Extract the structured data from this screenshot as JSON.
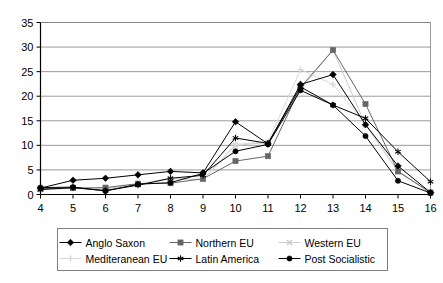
{
  "chart_data": {
    "type": "line",
    "title": "",
    "subtitle": "",
    "xlabel": "",
    "ylabel": "",
    "xlim": [
      4,
      16
    ],
    "ylim": [
      0,
      35
    ],
    "ytick_step": 5,
    "grid": true,
    "legend_position": "bottom",
    "x": [
      4,
      5,
      6,
      7,
      8,
      9,
      10,
      11,
      12,
      13,
      14,
      15,
      16
    ],
    "xtick_labels": [
      "4",
      "5",
      "6",
      "7",
      "8",
      "9",
      "10",
      "11",
      "12",
      "13",
      "14",
      "15",
      "16"
    ],
    "ytick_labels": [
      "0",
      "5",
      "10",
      "15",
      "20",
      "25",
      "30",
      "35"
    ],
    "series": [
      {
        "name": "Anglo Saxon",
        "marker": "diamond",
        "color": "#000000",
        "values": [
          1.3,
          2.9,
          3.3,
          4.0,
          4.7,
          4.4,
          14.8,
          10.3,
          22.4,
          24.4,
          14.2,
          5.8,
          0.4
        ]
      },
      {
        "name": "Northern EU",
        "marker": "square",
        "color": "#666666",
        "values": [
          1.2,
          1.3,
          1.4,
          2.2,
          2.3,
          3.2,
          6.8,
          7.8,
          21.8,
          29.4,
          18.4,
          4.7,
          0.4
        ]
      },
      {
        "name": "Western EU",
        "marker": "cross",
        "color": "#cccccc",
        "values": [
          1.1,
          1.2,
          1.1,
          2.0,
          3.2,
          3.0,
          10.0,
          10.6,
          21.4,
          29.4,
          14.2,
          4.6,
          0.3
        ]
      },
      {
        "name": "Mediteranean EU",
        "marker": "plus",
        "color": "#d9d9d9",
        "values": [
          1.2,
          1.3,
          1.2,
          2.1,
          3.3,
          3.1,
          10.2,
          10.7,
          25.4,
          22.4,
          14.3,
          4.8,
          0.4
        ]
      },
      {
        "name": "Latin America",
        "marker": "asterisk",
        "color": "#000000",
        "values": [
          1.0,
          1.4,
          0.8,
          1.9,
          3.3,
          3.9,
          11.5,
          10.4,
          21.9,
          18.2,
          15.5,
          8.7,
          2.6
        ]
      },
      {
        "name": "Post Socialistic",
        "marker": "circle",
        "color": "#000000",
        "values": [
          1.4,
          1.5,
          0.7,
          2.1,
          2.4,
          4.3,
          8.8,
          10.2,
          21.2,
          18.2,
          11.9,
          2.8,
          0.3
        ]
      }
    ]
  },
  "legend": {
    "items": [
      {
        "label": "Anglo Saxon"
      },
      {
        "label": "Northern EU"
      },
      {
        "label": "Western EU"
      },
      {
        "label": "Mediteranean EU"
      },
      {
        "label": "Latin America"
      },
      {
        "label": "Post Socialistic"
      }
    ]
  },
  "colors": {
    "axis": "#000000",
    "grid": "#808080",
    "plot_background": "#ffffff",
    "legend_border": "#808080"
  }
}
